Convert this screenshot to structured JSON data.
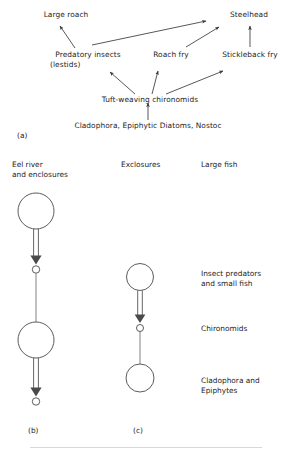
{
  "figure": {
    "background": "#ffffff",
    "stroke_color": "#3a3a3a",
    "text_color": "#1c1c1c"
  },
  "panel_a": {
    "tag": "(a)",
    "nodes": {
      "large_roach": "Large roach",
      "steelhead": "Steelhead",
      "predatory_insects_line1": "Predatory insects",
      "predatory_insects_line2": "(lestids)",
      "roach_fry": "Roach fry",
      "stickleback_fry": "Stickleback fry",
      "chironomids": "Tuft-weaving chironomids",
      "basal": "Cladophora, Epiphytic Diatoms, Nostoc"
    },
    "edges": [
      {
        "from": "predatory_insects",
        "to": "large_roach"
      },
      {
        "from": "predatory_insects",
        "to": "steelhead"
      },
      {
        "from": "roach_fry",
        "to": "steelhead"
      },
      {
        "from": "stickleback_fry",
        "to": "steelhead"
      },
      {
        "from": "chironomids",
        "to": "predatory_insects"
      },
      {
        "from": "chironomids",
        "to": "roach_fry"
      },
      {
        "from": "chironomids",
        "to": "stickleback_fry"
      },
      {
        "from": "basal",
        "to": "chironomids"
      }
    ]
  },
  "panel_b": {
    "tag": "(b)",
    "header_line1": "Eel river",
    "header_line2": "and enclosures",
    "chain": [
      {
        "shape": "large-circle",
        "connector": "double-arrow-down"
      },
      {
        "shape": "small-circle",
        "connector": "thin-line"
      },
      {
        "shape": "large-circle",
        "connector": "double-arrow-down"
      },
      {
        "shape": "small-circle",
        "connector": "none"
      }
    ]
  },
  "panel_c": {
    "tag": "(c)",
    "header": "Exclosures",
    "chain": [
      {
        "shape": "medium-circle",
        "connector": "double-arrow-down"
      },
      {
        "shape": "small-circle",
        "connector": "thin-line"
      },
      {
        "shape": "medium-circle",
        "connector": "none"
      }
    ]
  },
  "trophic_labels": {
    "header": "Large fish",
    "level_2_line1": "Insect predators",
    "level_2_line2": "and small fish",
    "level_3": "Chironomids",
    "level_4_line1": "Cladophora and",
    "level_4_line2": "Epiphytes"
  }
}
